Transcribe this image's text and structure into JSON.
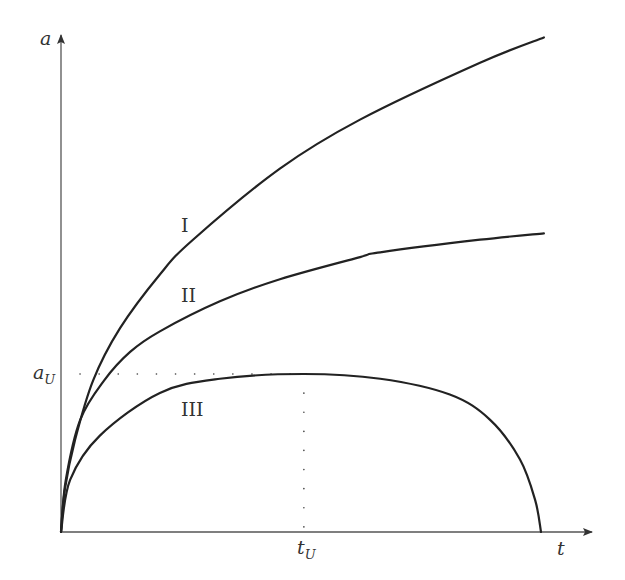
{
  "chart_data": {
    "type": "line",
    "title": "",
    "xlabel": "t",
    "ylabel": "a",
    "xlim": [
      0,
      1.11
    ],
    "ylim": [
      0,
      3.16
    ],
    "grid": false,
    "legend": "none",
    "annotations": {
      "x_marker": {
        "label": "t",
        "subscript": "U",
        "value": 0.506
      },
      "y_marker": {
        "label": "a",
        "subscript": "U",
        "value": 1.0
      }
    },
    "series": [
      {
        "name": "I",
        "x": [
          0,
          0.008,
          0.029,
          0.067,
          0.123,
          0.206,
          0.275,
          0.456,
          0.623,
          0.873,
          1.006
        ],
        "y": [
          0,
          0.27,
          0.58,
          0.96,
          1.29,
          1.63,
          1.85,
          2.3,
          2.61,
          2.97,
          3.13
        ]
      },
      {
        "name": "II",
        "x": [
          0,
          0.01,
          0.04,
          0.09,
          0.144,
          0.206,
          0.331,
          0.456,
          0.623,
          0.665,
          0.873,
          1.006
        ],
        "y": [
          0,
          0.33,
          0.71,
          0.96,
          1.14,
          1.27,
          1.46,
          1.6,
          1.74,
          1.77,
          1.85,
          1.89
        ]
      },
      {
        "name": "III",
        "x": [
          0,
          0.019,
          0.081,
          0.206,
          0.331,
          0.506,
          0.665,
          0.81,
          0.894,
          0.956,
          0.988,
          1.0
        ],
        "y": [
          0,
          0.33,
          0.61,
          0.88,
          0.97,
          1.0,
          0.97,
          0.87,
          0.71,
          0.46,
          0.2,
          0
        ]
      }
    ]
  }
}
